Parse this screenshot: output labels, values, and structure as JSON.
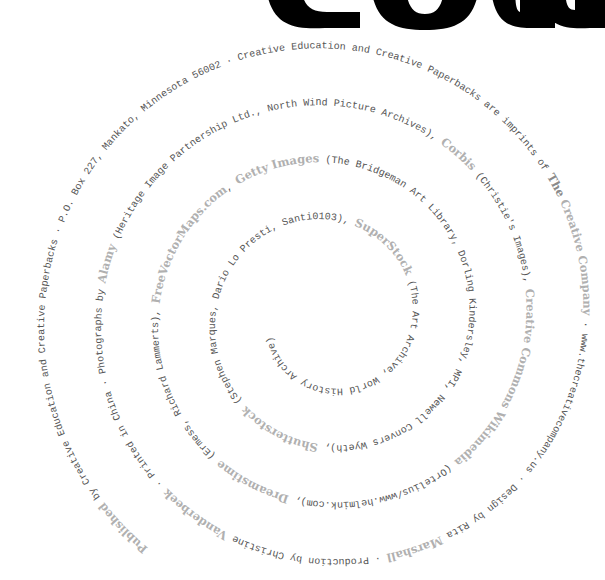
{
  "title_fragment": {
    "letters": "CONGS",
    "color": "#000000"
  },
  "spiral": {
    "center": [
      328,
      318
    ],
    "start_radius": 292,
    "pitch_per_turn": 57,
    "start_angle_deg": 128,
    "direction": "clockwise-inward",
    "colors": {
      "regular_text": "#555555",
      "brand_text": "#b0b0b0"
    },
    "segments": [
      {
        "text": "Published",
        "style": "brand"
      },
      {
        "text": " by Creative Education and Creative Paperbacks · P.O. Box 227, Mankato, Minnesota 56002 · Creative Education and Creative Paperbacks are imprints of ",
        "style": "reg"
      },
      {
        "text": "The",
        "style": "brand-dark"
      },
      {
        "text": " Creative Company",
        "style": "brand"
      },
      {
        "text": " · www.thecreativecompany.us · Design by Rita ",
        "style": "reg"
      },
      {
        "text": "Marshall",
        "style": "brand"
      },
      {
        "text": " · Production by Christine ",
        "style": "reg"
      },
      {
        "text": "Vanderbeek",
        "style": "brand"
      },
      {
        "text": " · Printed in China · Photographs by ",
        "style": "reg"
      },
      {
        "text": "Alamy",
        "style": "brand"
      },
      {
        "text": " (Heritage Image Partnership Ltd., North Wind Picture Archives), ",
        "style": "reg"
      },
      {
        "text": "Corbis",
        "style": "brand"
      },
      {
        "text": " (Christie's Images), ",
        "style": "reg"
      },
      {
        "text": "Creative Commons Wikimedia",
        "style": "brand"
      },
      {
        "text": " (Ortelius/www.helmink.com), ",
        "style": "reg"
      },
      {
        "text": "Dreamstime",
        "style": "brand"
      },
      {
        "text": " (Ermess, Richard Lammerts), ",
        "style": "reg"
      },
      {
        "text": "FreeVectorMaps.com",
        "style": "brand"
      },
      {
        "text": ", ",
        "style": "reg"
      },
      {
        "text": "Getty Images",
        "style": "brand"
      },
      {
        "text": " (The Bridgeman Art Library, Dorling Kindersley, MPI, Newell Convers Wyeth), ",
        "style": "reg"
      },
      {
        "text": "Shutterstock",
        "style": "brand"
      },
      {
        "text": " (Stephen Marques, Dario Lo Presti, Santi0103), ",
        "style": "reg"
      },
      {
        "text": "SuperStock",
        "style": "brand"
      },
      {
        "text": " (The Art Archive, World History Archive)",
        "style": "reg"
      }
    ]
  }
}
